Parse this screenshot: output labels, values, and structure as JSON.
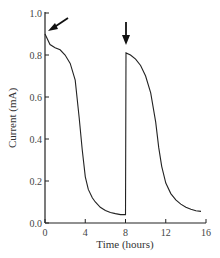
{
  "chart_data": {
    "type": "line",
    "title": "",
    "xlabel": "Time (hours)",
    "ylabel": "Current (mA)",
    "xlim": [
      0,
      16
    ],
    "ylim": [
      0.0,
      1.0
    ],
    "x_ticks": [
      "0",
      "4",
      "8",
      "12",
      "16"
    ],
    "y_ticks": [
      "0.0",
      "0.2",
      "0.4",
      "0.6",
      "0.8",
      "1.0"
    ],
    "grid": false,
    "legend": null,
    "series": [
      {
        "name": "Current",
        "x": [
          0,
          0.5,
          1,
          1.5,
          2,
          2.5,
          3,
          3.4,
          3.7,
          4,
          4.3,
          4.7,
          5,
          5.5,
          6,
          6.5,
          7,
          7.5,
          8,
          8.05,
          8.5,
          9,
          9.5,
          10,
          10.5,
          11,
          11.3,
          11.6,
          12,
          12.5,
          13,
          13.5,
          14,
          14.5,
          15,
          15.5
        ],
        "y": [
          0.9,
          0.85,
          0.835,
          0.825,
          0.8,
          0.76,
          0.68,
          0.5,
          0.35,
          0.22,
          0.16,
          0.12,
          0.1,
          0.075,
          0.06,
          0.05,
          0.045,
          0.04,
          0.04,
          0.81,
          0.8,
          0.78,
          0.75,
          0.7,
          0.62,
          0.48,
          0.36,
          0.27,
          0.19,
          0.14,
          0.11,
          0.09,
          0.075,
          0.065,
          0.058,
          0.055
        ]
      }
    ],
    "annotations": [
      {
        "type": "arrow",
        "at_x": 0,
        "at_y": 0.9,
        "direction": "down-left"
      },
      {
        "type": "arrow",
        "at_x": 8,
        "at_y": 0.81,
        "direction": "down"
      }
    ]
  }
}
